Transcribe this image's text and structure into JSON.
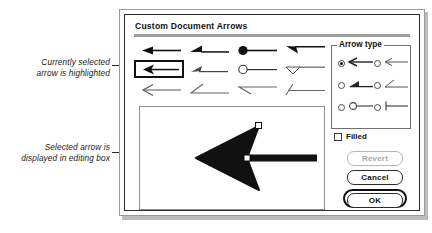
{
  "annotations": [
    {
      "name": "selected-highlight",
      "text_line1": "Currently selected",
      "text_line2": "arrow is highlighted"
    },
    {
      "name": "editing-box",
      "text_line1": "Selected arrow is",
      "text_line2": "displayed in editing box"
    }
  ],
  "dialog": {
    "title": "Custom Document Arrows",
    "arrow_grid": {
      "rows": [
        [
          {
            "style": "filled-triangle-arrow",
            "selected": false
          },
          {
            "style": "filled-half-barb-arrow",
            "selected": false
          },
          {
            "style": "filled-circle-arrow",
            "selected": false
          },
          {
            "style": "filled-barb-arrow",
            "selected": false
          }
        ],
        [
          {
            "style": "open-v-arrow",
            "selected": true
          },
          {
            "style": "open-half-barb-arrow",
            "selected": false
          },
          {
            "style": "open-circle-arrow",
            "selected": false
          },
          {
            "style": "open-triangle-arrow",
            "selected": false
          }
        ],
        [
          {
            "style": "line-v-arrow",
            "selected": false
          },
          {
            "style": "line-half-barb-up-arrow",
            "selected": false
          },
          {
            "style": "line-half-barb-down-arrow",
            "selected": false
          },
          {
            "style": "line-slash-arrow",
            "selected": false
          }
        ]
      ]
    },
    "editing_box": {
      "name": "arrow-editing-canvas",
      "shape": "open-v-arrowhead-with-shaft",
      "handles": 2
    },
    "arrow_type": {
      "legend": "Arrow type",
      "options": [
        {
          "icon": "open-v-arrow-icon",
          "selected": true
        },
        {
          "icon": "thin-v-arrow-icon",
          "selected": false
        },
        {
          "icon": "filled-half-barb-arrow-icon",
          "selected": false
        },
        {
          "icon": "thin-half-barb-arrow-icon",
          "selected": false
        },
        {
          "icon": "circle-end-arrow-icon",
          "selected": false
        },
        {
          "icon": "tee-end-arrow-icon",
          "selected": false
        }
      ],
      "filled_checkbox": {
        "label": "Filled",
        "checked": false
      }
    },
    "buttons": {
      "revert": {
        "label": "Revert",
        "enabled": false
      },
      "cancel": {
        "label": "Cancel",
        "enabled": true
      },
      "ok": {
        "label": "OK",
        "enabled": true,
        "default": true
      }
    }
  },
  "colors": {
    "ink": "#111111",
    "dialog_bg": "#ffffff",
    "rule": "#9d9d9d",
    "disabled": "#a8a8a8",
    "shadow": "#bdbdbd"
  }
}
